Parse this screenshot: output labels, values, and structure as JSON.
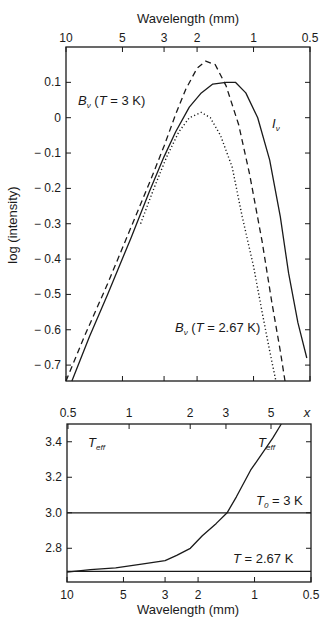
{
  "chart_data": [
    {
      "id": "upper",
      "type": "line",
      "title": "",
      "xlabel": "Wavelength (mm)",
      "xlabel_position": "top",
      "ylabel": "log (intensity)",
      "xscale": "log",
      "xlim": [
        10,
        0.5
      ],
      "ylim": [
        -0.745,
        0.2
      ],
      "x_ticks": [
        10,
        5,
        3,
        2,
        1,
        0.5
      ],
      "x_tick_labels": [
        "10",
        "5",
        "3",
        "2",
        "1",
        "0.5"
      ],
      "y_ticks": [
        0.1,
        0,
        -0.1,
        -0.2,
        -0.3,
        -0.4,
        -0.5,
        -0.6,
        -0.7
      ],
      "y_tick_labels": [
        "0.1",
        "0",
        "− 0.1",
        "− 0.2",
        "− 0.3",
        "− 0.4",
        "− 0.5",
        "− 0.6",
        "− 0.7"
      ],
      "grid": false,
      "series": [
        {
          "name": "B_v (T = 3 K)",
          "style": "dashed",
          "points": [
            [
              10,
              -0.745
            ],
            [
              8.0,
              -0.62
            ],
            [
              6.0,
              -0.47
            ],
            [
              4.5,
              -0.31
            ],
            [
              3.5,
              -0.17
            ],
            [
              3.0,
              -0.08
            ],
            [
              2.6,
              0.01
            ],
            [
              2.3,
              0.08
            ],
            [
              2.0,
              0.14
            ],
            [
              1.8,
              0.16
            ],
            [
              1.6,
              0.15
            ],
            [
              1.4,
              0.09
            ],
            [
              1.2,
              -0.02
            ],
            [
              1.05,
              -0.16
            ],
            [
              0.9,
              -0.35
            ],
            [
              0.8,
              -0.52
            ],
            [
              0.72,
              -0.66
            ],
            [
              0.68,
              -0.745
            ]
          ]
        },
        {
          "name": "I_v",
          "style": "solid",
          "points": [
            [
              9.3,
              -0.745
            ],
            [
              7.5,
              -0.62
            ],
            [
              6.0,
              -0.5
            ],
            [
              4.5,
              -0.34
            ],
            [
              3.6,
              -0.21
            ],
            [
              3.0,
              -0.11
            ],
            [
              2.6,
              -0.04
            ],
            [
              2.2,
              0.03
            ],
            [
              1.9,
              0.07
            ],
            [
              1.65,
              0.095
            ],
            [
              1.4,
              0.1
            ],
            [
              1.25,
              0.1
            ],
            [
              1.1,
              0.07
            ],
            [
              0.95,
              0.0
            ],
            [
              0.82,
              -0.12
            ],
            [
              0.72,
              -0.28
            ],
            [
              0.65,
              -0.44
            ],
            [
              0.58,
              -0.58
            ],
            [
              0.52,
              -0.68
            ]
          ]
        },
        {
          "name": "B_v (T = 2.67 K)",
          "style": "dotted",
          "points": [
            [
              4.0,
              -0.3
            ],
            [
              3.4,
              -0.2
            ],
            [
              2.9,
              -0.11
            ],
            [
              2.5,
              -0.04
            ],
            [
              2.2,
              0.0
            ],
            [
              1.9,
              0.015
            ],
            [
              1.7,
              0.0
            ],
            [
              1.5,
              -0.05
            ],
            [
              1.3,
              -0.14
            ],
            [
              1.15,
              -0.28
            ],
            [
              1.0,
              -0.42
            ],
            [
              0.9,
              -0.55
            ],
            [
              0.82,
              -0.66
            ],
            [
              0.76,
              -0.745
            ]
          ]
        }
      ],
      "annotations": [
        {
          "text": "B_v (T = 3 K)",
          "x": 7.5,
          "y": 0.08
        },
        {
          "text": "I_v",
          "x": 0.66,
          "y": -0.04
        },
        {
          "text": "B_v (T = 2.67 K)",
          "x": 1.6,
          "y": -0.58
        }
      ]
    },
    {
      "id": "lower",
      "type": "line",
      "title": "",
      "xlabel": "Wavelength (mm)",
      "xlabel_position": "bottom",
      "x2label": "x",
      "ylabel": "",
      "xscale": "log",
      "xlim": [
        10,
        0.5
      ],
      "ylim": [
        2.61,
        3.5
      ],
      "x_ticks": [
        10,
        5,
        3,
        2,
        1,
        0.5
      ],
      "x_tick_labels": [
        "10",
        "5",
        "3",
        "2",
        "1",
        "0.5"
      ],
      "x2_ticks": [
        0.5,
        1,
        2,
        3,
        5
      ],
      "x2_tick_labels": [
        "0.5",
        "1",
        "2",
        "3",
        "5"
      ],
      "y_ticks": [
        3.4,
        3.2,
        3.0,
        2.8
      ],
      "y_tick_labels": [
        "3.4",
        "3.2",
        "3.0",
        "2.8"
      ],
      "grid": false,
      "series": [
        {
          "name": "T_eff",
          "style": "solid",
          "points": [
            [
              10,
              2.666
            ],
            [
              7.5,
              2.68
            ],
            [
              5.5,
              2.69
            ],
            [
              4.0,
              2.71
            ],
            [
              3.0,
              2.73
            ],
            [
              2.6,
              2.76
            ],
            [
              2.2,
              2.8
            ],
            [
              1.9,
              2.87
            ],
            [
              1.6,
              2.94
            ],
            [
              1.4,
              3.0
            ],
            [
              1.25,
              3.09
            ],
            [
              1.05,
              3.24
            ],
            [
              0.8,
              3.42
            ],
            [
              0.72,
              3.5
            ]
          ]
        },
        {
          "name": "T_0 = 3 K",
          "style": "solid",
          "points": [
            [
              10,
              3.0
            ],
            [
              0.5,
              3.0
            ]
          ]
        },
        {
          "name": "T = 2.67 K",
          "style": "solid",
          "points": [
            [
              10,
              2.67
            ],
            [
              0.5,
              2.67
            ]
          ]
        }
      ],
      "annotations": [
        {
          "text": "T_eff",
          "x": 8.5,
          "y": 3.4
        },
        {
          "text": "T_eff",
          "x": 0.78,
          "y": 3.4
        },
        {
          "text": "T_0 = 3 K",
          "x": 0.65,
          "y": 3.04
        },
        {
          "text": "T = 2.67 K",
          "x": 0.65,
          "y": 2.72
        }
      ]
    }
  ],
  "labels": {
    "upper_xlabel": "Wavelength (mm)",
    "upper_ylabel": "log (intensity)",
    "lower_xlabel": "Wavelength (mm)",
    "lower_x2": "x",
    "b3_B": "B",
    "b3_sub": "ν",
    "b3_rest": " (",
    "b3_T": "T",
    "b3_val": " = 3 K)",
    "iv_I": "I",
    "iv_sub": "ν",
    "b267_B": "B",
    "b267_sub": "ν",
    "b267_rest": " (",
    "b267_T": "T",
    "b267_val": " = 2.67 K)",
    "teff_T": "T",
    "teff_sub": "eff",
    "t0_T": "T",
    "t0_sub": "0",
    "t0_val": " = 3 K",
    "t267_T": "T",
    "t267_val": " = 2.67 K"
  }
}
